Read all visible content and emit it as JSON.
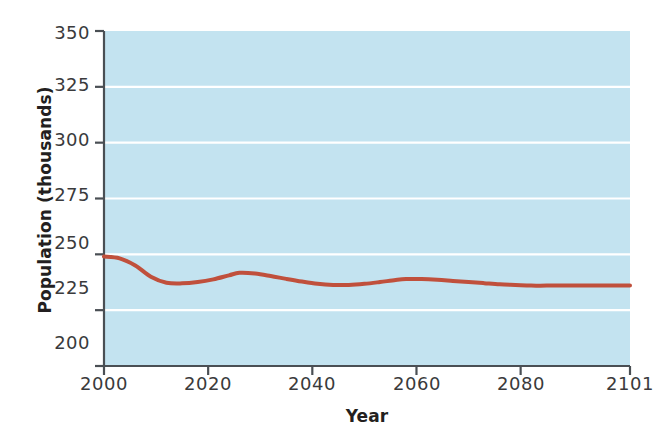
{
  "chart_data": {
    "type": "line",
    "title": "",
    "xlabel": "Year",
    "ylabel": "Population (thousands)",
    "xlim": [
      2000,
      2101
    ],
    "ylim": [
      200,
      350
    ],
    "xticks": [
      2000,
      2020,
      2040,
      2060,
      2080,
      2101
    ],
    "xtick_labels": [
      "2000",
      "2020",
      "2040",
      "2060",
      "2080",
      "2101"
    ],
    "yticks": [
      200,
      225,
      250,
      275,
      300,
      325,
      350
    ],
    "ytick_labels": [
      "200",
      "225",
      "250",
      "275",
      "300",
      "325",
      "350"
    ],
    "grid": true,
    "grid_axis": "y",
    "legend": "none",
    "plot_background_color": "#c3e3f0",
    "grid_color": "#ffffff",
    "axis_color": "#4a4f54",
    "series": [
      {
        "name": "Population",
        "color": "#c0503c",
        "line_width": 4,
        "x": [
          2000,
          2003,
          2006,
          2009,
          2012,
          2015,
          2018,
          2021,
          2024,
          2026,
          2029,
          2032,
          2035,
          2038,
          2041,
          2044,
          2047,
          2050,
          2053,
          2056,
          2058,
          2061,
          2064,
          2067,
          2070,
          2073,
          2076,
          2079,
          2082,
          2085,
          2090,
          2095,
          2101
        ],
        "values": [
          249.0,
          248.2,
          245.0,
          240.0,
          237.3,
          237.0,
          237.6,
          238.8,
          240.6,
          241.7,
          241.4,
          240.3,
          239.0,
          237.8,
          236.8,
          236.3,
          236.3,
          236.8,
          237.6,
          238.5,
          238.9,
          238.9,
          238.6,
          238.1,
          237.6,
          237.1,
          236.6,
          236.3,
          236.0,
          236.0,
          236.0,
          236.0,
          236.0
        ]
      }
    ]
  },
  "axes": {
    "plot_left_px": 104,
    "plot_right_px": 630,
    "plot_top_px": 31,
    "plot_bottom_px": 366
  }
}
